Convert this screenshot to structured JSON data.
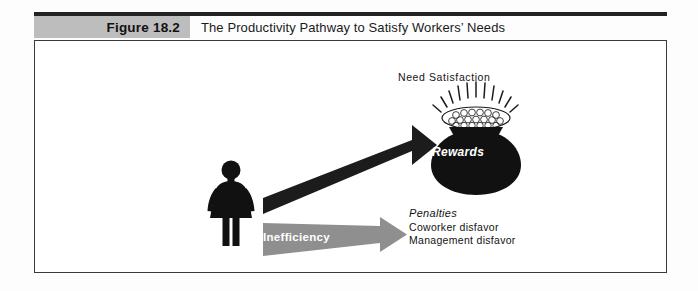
{
  "figure": {
    "number_label": "Figure 18.2",
    "title": "The Productivity Pathway to Satisfy Workers’ Needs"
  },
  "diagram": {
    "need_satisfaction_label": "Need Satisfaction",
    "rewards_label": "Rewards",
    "arrows": [
      {
        "label": "Productivity",
        "color": "#1c1c1c",
        "direction": "up-right"
      },
      {
        "label": "Inefficiency",
        "color": "#8f8f8f",
        "direction": "right"
      }
    ],
    "penalties": {
      "title": "Penalties",
      "items": [
        "Coworker disfavor",
        "Management disfavor"
      ]
    },
    "worker_icon": "female-figure-icon",
    "reward_icon": "pot-of-coins-icon"
  },
  "colors": {
    "header_rule": "#222222",
    "figure_number_bg": "#bdbdbd",
    "frame_border": "#3a3a3a",
    "dark_arrow": "#1c1c1c",
    "gray_arrow": "#8f8f8f",
    "pot_fill": "#111111"
  }
}
